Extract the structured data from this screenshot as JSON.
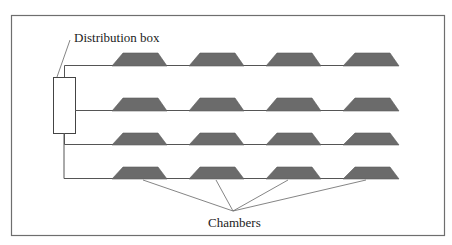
{
  "diagram": {
    "labels": {
      "distribution_box": "Distribution box",
      "chambers": "Chambers"
    },
    "colors": {
      "frame": "#6e6e6e",
      "line": "#555555",
      "chamber_fill": "#6b6b6b",
      "background": "#ffffff"
    },
    "rows": 4,
    "chambers_per_row": 4,
    "total_chambers": 16
  }
}
